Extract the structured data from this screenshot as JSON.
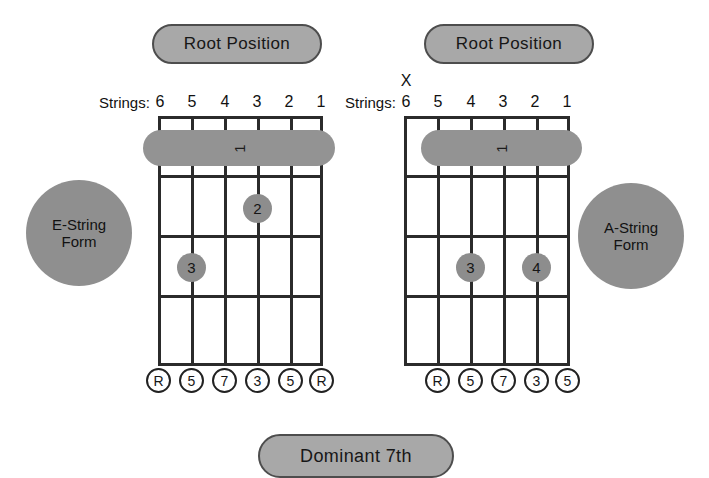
{
  "page": {
    "background_color": "#ffffff",
    "accent_gray": "#8f8f8f",
    "line_color": "#2b2b2b"
  },
  "banners": {
    "left_top": "Root Position",
    "right_top": "Root Position",
    "bottom": "Dominant 7th"
  },
  "forms": {
    "left": {
      "line1": "E-String",
      "line2": "Form"
    },
    "right": {
      "line1": "A-String",
      "line2": "Form"
    }
  },
  "diagrams": [
    {
      "id": "e-string-form",
      "strings_label": "Strings:",
      "string_numbers": [
        "6",
        "5",
        "4",
        "3",
        "2",
        "1"
      ],
      "muted_strings": [],
      "mute_symbol": "X",
      "frets": 4,
      "barre": {
        "finger": "1",
        "fret": 1,
        "from_string": 6,
        "to_string": 1
      },
      "dots": [
        {
          "finger": "2",
          "string": 3,
          "fret": 2
        },
        {
          "finger": "3",
          "string": 5,
          "fret": 3
        }
      ],
      "intervals": [
        "R",
        "5",
        "7",
        "3",
        "5",
        "R"
      ]
    },
    {
      "id": "a-string-form",
      "strings_label": "Strings:",
      "string_numbers": [
        "6",
        "5",
        "4",
        "3",
        "2",
        "1"
      ],
      "muted_strings": [
        6
      ],
      "mute_symbol": "X",
      "frets": 4,
      "barre": {
        "finger": "1",
        "fret": 1,
        "from_string": 5,
        "to_string": 1
      },
      "dots": [
        {
          "finger": "3",
          "string": 4,
          "fret": 3
        },
        {
          "finger": "4",
          "string": 2,
          "fret": 3
        }
      ],
      "intervals": [
        "R",
        "5",
        "7",
        "3",
        "5"
      ]
    }
  ]
}
